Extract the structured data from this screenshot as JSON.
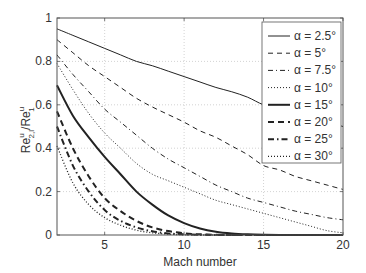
{
  "chart_data": {
    "type": "line",
    "title": "",
    "xlabel": "Mach number",
    "ylabel_main": "Re",
    "ylabel_parts": {
      "num_base": "Re",
      "num_sup": "u",
      "num_sub": "2,l",
      "slash": "/",
      "den_base": "Re",
      "den_sup": "u",
      "den_sub": "1"
    },
    "xlim": [
      2,
      20
    ],
    "ylim": [
      0,
      1
    ],
    "xticks": [
      5,
      10,
      15,
      20
    ],
    "yticks": [
      0,
      0.2,
      0.4,
      0.6,
      0.8,
      1
    ],
    "ytick_labels": [
      "0",
      "0.2",
      "0.4",
      "0.6",
      "0.8",
      "1"
    ],
    "xtick_labels": [
      "5",
      "10",
      "15",
      "20"
    ],
    "grid": true,
    "legend_position": "upper right",
    "x": [
      2,
      3,
      4,
      5,
      6,
      7,
      8,
      9,
      10,
      11,
      12,
      13,
      14,
      15,
      16,
      17,
      18,
      19,
      20
    ],
    "series": [
      {
        "name": "α = 2.5°",
        "style": "solid",
        "width": 1,
        "values": [
          0.95,
          0.92,
          0.89,
          0.86,
          0.83,
          0.8,
          0.78,
          0.755,
          0.73,
          0.705,
          0.68,
          0.66,
          0.635,
          0.6,
          0.585,
          0.56,
          0.54,
          0.52,
          0.5
        ]
      },
      {
        "name": "α = 5°",
        "style": "dashed",
        "width": 1,
        "values": [
          0.9,
          0.84,
          0.78,
          0.73,
          0.68,
          0.63,
          0.59,
          0.555,
          0.52,
          0.48,
          0.45,
          0.41,
          0.37,
          0.32,
          0.3,
          0.27,
          0.25,
          0.23,
          0.21
        ]
      },
      {
        "name": "α = 7.5°",
        "style": "dashdot",
        "width": 1,
        "values": [
          0.83,
          0.74,
          0.66,
          0.58,
          0.52,
          0.46,
          0.4,
          0.35,
          0.31,
          0.27,
          0.23,
          0.2,
          0.17,
          0.15,
          0.13,
          0.11,
          0.095,
          0.08,
          0.07
        ]
      },
      {
        "name": "α = 10°",
        "style": "dotted",
        "width": 1,
        "values": [
          0.79,
          0.67,
          0.56,
          0.47,
          0.4,
          0.33,
          0.28,
          0.25,
          0.22,
          0.19,
          0.16,
          0.14,
          0.12,
          0.1,
          0.08,
          0.06,
          0.04,
          0.02,
          0.01
        ]
      },
      {
        "name": "α = 15°",
        "style": "solid",
        "width": 2,
        "values": [
          0.69,
          0.55,
          0.45,
          0.36,
          0.28,
          0.2,
          0.14,
          0.09,
          0.055,
          0.03,
          0.015,
          0.007,
          0.003,
          0.001,
          0.0,
          0.0,
          0.0,
          0.0,
          0.0
        ]
      },
      {
        "name": "α = 20°",
        "style": "dashed",
        "width": 2,
        "values": [
          0.57,
          0.4,
          0.27,
          0.17,
          0.11,
          0.065,
          0.035,
          0.018,
          0.008,
          0.003,
          0.001,
          0.0,
          0.0,
          0.0,
          0.0,
          0.0,
          0.0,
          0.0,
          0.0
        ]
      },
      {
        "name": "α = 25°",
        "style": "dashdot",
        "width": 2,
        "values": [
          0.5,
          0.32,
          0.2,
          0.115,
          0.065,
          0.035,
          0.017,
          0.007,
          0.003,
          0.001,
          0.0,
          0.0,
          0.0,
          0.0,
          0.0,
          0.0,
          0.0,
          0.0,
          0.0
        ]
      },
      {
        "name": "α = 30°",
        "style": "dotted",
        "width": 1.3,
        "values": [
          0.41,
          0.24,
          0.14,
          0.08,
          0.045,
          0.022,
          0.01,
          0.004,
          0.001,
          0.0,
          0.0,
          0.0,
          0.0,
          0.0,
          0.0,
          0.0,
          0.0,
          0.0,
          0.0
        ]
      }
    ]
  },
  "colors": {
    "axis": "#555555",
    "line": "#222222",
    "grid": "#c8c8c8",
    "text": "#333333"
  }
}
